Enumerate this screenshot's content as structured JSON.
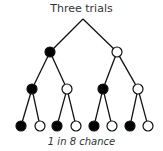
{
  "title": "Three trials",
  "caption": "1 in 8 chance",
  "colors": {
    "filled": "#000000",
    "empty": "#ffffff",
    "stroke": "#111111"
  },
  "tree": {
    "root": {
      "x": 83,
      "y": 19
    },
    "nodes": [
      {
        "id": "l1a",
        "x": 50,
        "y": 52,
        "parent": "root",
        "outcome": "filled"
      },
      {
        "id": "l1b",
        "x": 117,
        "y": 52,
        "parent": "root",
        "outcome": "empty"
      },
      {
        "id": "l2a",
        "x": 32,
        "y": 89,
        "parent": "l1a",
        "outcome": "filled"
      },
      {
        "id": "l2b",
        "x": 67,
        "y": 89,
        "parent": "l1a",
        "outcome": "empty"
      },
      {
        "id": "l2c",
        "x": 103,
        "y": 89,
        "parent": "l1b",
        "outcome": "filled"
      },
      {
        "id": "l2d",
        "x": 138,
        "y": 89,
        "parent": "l1b",
        "outcome": "empty"
      },
      {
        "id": "l3a",
        "x": 21,
        "y": 126,
        "parent": "l2a",
        "outcome": "filled"
      },
      {
        "id": "l3b",
        "x": 40,
        "y": 126,
        "parent": "l2a",
        "outcome": "empty"
      },
      {
        "id": "l3c",
        "x": 57,
        "y": 126,
        "parent": "l2b",
        "outcome": "filled"
      },
      {
        "id": "l3d",
        "x": 76,
        "y": 126,
        "parent": "l2b",
        "outcome": "empty"
      },
      {
        "id": "l3e",
        "x": 94,
        "y": 126,
        "parent": "l2c",
        "outcome": "filled"
      },
      {
        "id": "l3f",
        "x": 112,
        "y": 126,
        "parent": "l2c",
        "outcome": "empty"
      },
      {
        "id": "l3g",
        "x": 130,
        "y": 126,
        "parent": "l2d",
        "outcome": "filled"
      },
      {
        "id": "l3h",
        "x": 148,
        "y": 126,
        "parent": "l2d",
        "outcome": "empty"
      }
    ]
  }
}
